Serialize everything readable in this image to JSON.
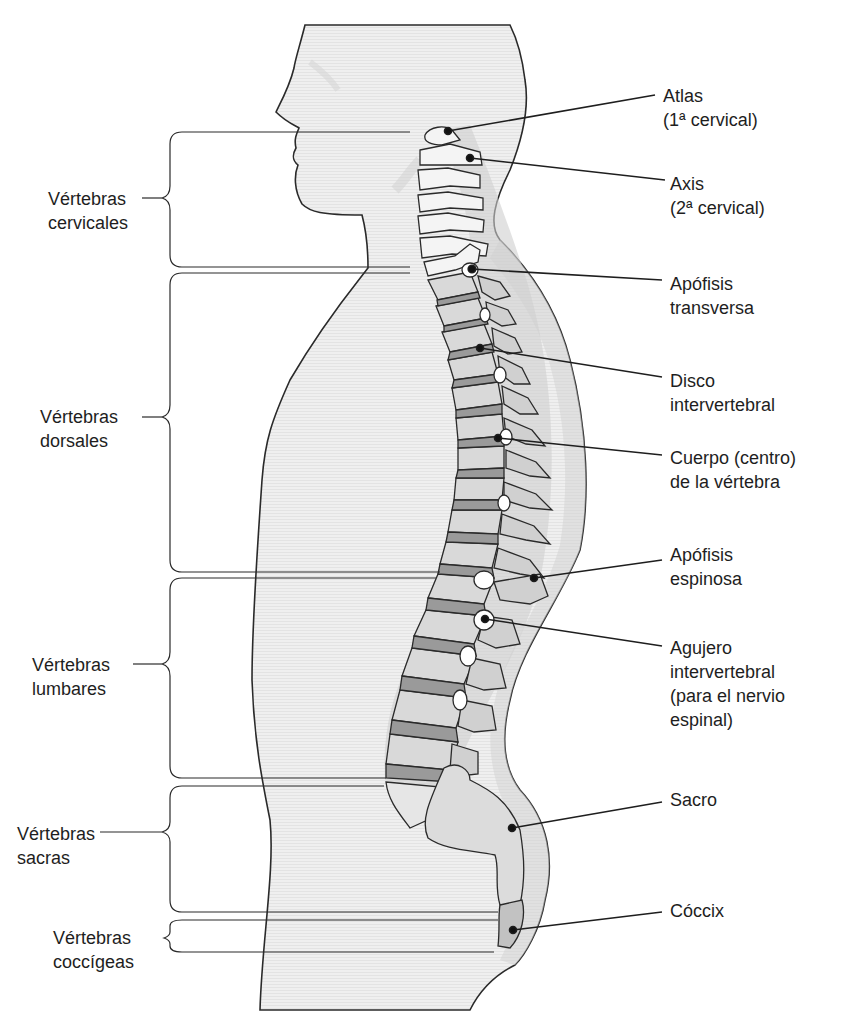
{
  "diagram": {
    "colors": {
      "body_fill": "#eeeeee",
      "body_shadow": "#d6d6d6",
      "bone_fill": "#d9d9d9",
      "bone_light": "#f2f2f2",
      "disc_fill": "#9a9a9a",
      "outline": "#2a2a2a"
    },
    "regions": [
      {
        "id": "cervical",
        "line1": "Vértebras",
        "line2": "cervicales"
      },
      {
        "id": "dorsal",
        "line1": "Vértebras",
        "line2": "dorsales"
      },
      {
        "id": "lumbar",
        "line1": "Vértebras",
        "line2": "lumbares"
      },
      {
        "id": "sacral",
        "line1": "Vértebras",
        "line2": "sacras"
      },
      {
        "id": "coccygeal",
        "line1": "Vértebras",
        "line2": "coccígeas"
      }
    ],
    "callouts": [
      {
        "id": "atlas",
        "lines": [
          "Atlas",
          "(1ª cervical)"
        ]
      },
      {
        "id": "axis",
        "lines": [
          "Axis",
          "(2ª cervical)"
        ]
      },
      {
        "id": "transverse-process",
        "lines": [
          "Apófisis",
          "transversa"
        ]
      },
      {
        "id": "intervertebral-disc",
        "lines": [
          "Disco",
          "intervertebral"
        ]
      },
      {
        "id": "vertebral-body",
        "lines": [
          "Cuerpo (centro)",
          "de la vértebra"
        ]
      },
      {
        "id": "spinous-process",
        "lines": [
          "Apófisis",
          "espinosa"
        ]
      },
      {
        "id": "intervertebral-foramen",
        "lines": [
          "Agujero",
          "intervertebral",
          "(para el nervio",
          "espinal)"
        ]
      },
      {
        "id": "sacrum",
        "lines": [
          "Sacro"
        ]
      },
      {
        "id": "coccyx",
        "lines": [
          "Cóccix"
        ]
      }
    ]
  }
}
